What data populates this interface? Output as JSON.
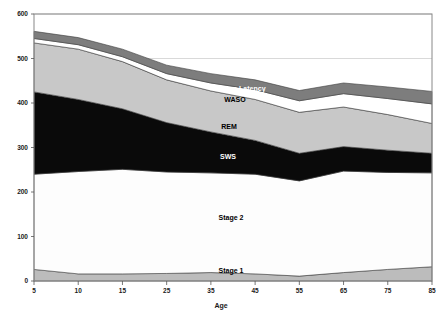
{
  "chart_data": {
    "type": "area",
    "stacked": true,
    "title": "",
    "xlabel": "Age",
    "ylabel": "",
    "x": [
      5,
      10,
      15,
      25,
      35,
      45,
      55,
      65,
      75,
      85
    ],
    "xtick_labels": [
      "5",
      "10",
      "15",
      "25",
      "35",
      "45",
      "55",
      "65",
      "75",
      "85"
    ],
    "ytick_labels": [
      "0",
      "100",
      "200",
      "300",
      "400",
      "500",
      "600"
    ],
    "yticks": [
      0,
      100,
      200,
      300,
      400,
      500,
      600
    ],
    "ylim": [
      0,
      600
    ],
    "grid": true,
    "legend_position": "inline-labels",
    "series": [
      {
        "name": "Stage 1",
        "color": "#bcbcbc",
        "label_color": "#000000",
        "values": [
          26,
          16,
          16,
          17,
          19,
          16,
          11,
          19,
          26,
          32
        ]
      },
      {
        "name": "Stage 2",
        "color": "#fdfdfd",
        "label_color": "#000000",
        "values": [
          214,
          230,
          235,
          228,
          224,
          224,
          214,
          228,
          218,
          211
        ]
      },
      {
        "name": "SWS",
        "color": "#0a0a0a",
        "label_color": "#ffffff",
        "values": [
          185,
          162,
          136,
          111,
          92,
          76,
          62,
          55,
          50,
          44
        ]
      },
      {
        "name": "REM",
        "color": "#c8c8c8",
        "label_color": "#000000",
        "values": [
          110,
          113,
          106,
          96,
          92,
          92,
          92,
          89,
          80,
          67
        ]
      },
      {
        "name": "WASO",
        "color": "#ffffff",
        "label_color": "#000000",
        "values": [
          10,
          10,
          11,
          14,
          18,
          22,
          26,
          30,
          36,
          44
        ]
      },
      {
        "name": "Sleep Latency",
        "color": "#7d7d7d",
        "label_color": "#ffffff",
        "values": [
          16,
          16,
          17,
          19,
          21,
          22,
          23,
          24,
          26,
          28
        ]
      }
    ],
    "inline_labels": [
      {
        "text": "Sleep Latency",
        "x": 242,
        "y": 91,
        "on_dark": true,
        "name": "series-label-sleep-latency"
      },
      {
        "text": "WASO",
        "x": 235,
        "y": 102,
        "on_dark": false,
        "name": "series-label-waso"
      },
      {
        "text": "REM",
        "x": 229,
        "y": 129,
        "on_dark": false,
        "name": "series-label-rem"
      },
      {
        "text": "SWS",
        "x": 228,
        "y": 159,
        "on_dark": true,
        "name": "series-label-sws"
      },
      {
        "text": "Stage 2",
        "x": 231,
        "y": 220,
        "on_dark": false,
        "name": "series-label-stage-2"
      },
      {
        "text": "Stage 1",
        "x": 231,
        "y": 273,
        "on_dark": false,
        "name": "series-label-stage-1"
      }
    ]
  },
  "axes": {
    "x_axis_title": "Age",
    "plot_border_color": "#888888",
    "gridline_color": "#cfcfcf"
  }
}
